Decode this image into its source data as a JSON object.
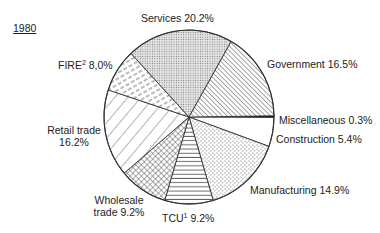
{
  "chart_data": {
    "type": "pie",
    "title": "1980",
    "start_angle_deg": 0,
    "direction": "clockwise",
    "slices": [
      {
        "label": "Miscellaneous",
        "value": 0.3,
        "display": "Miscellaneous 0.3%",
        "pattern": "solid-black"
      },
      {
        "label": "Construction",
        "value": 5.4,
        "display": "Construction 5.4%",
        "pattern": "blank"
      },
      {
        "label": "Manufacturing",
        "value": 14.9,
        "display": "Manufacturing 14.9%",
        "pattern": "stipple"
      },
      {
        "label": "TCU",
        "footnote": "1",
        "value": 9.2,
        "display": "TCU 9.2%",
        "pattern": "horizontal-lines"
      },
      {
        "label": "Wholesale trade",
        "value": 9.2,
        "display": "Wholesale trade 9.2%",
        "pattern": "crosshatch"
      },
      {
        "label": "Retail trade",
        "value": 16.2,
        "display": "Retail trade 16.2%",
        "pattern": "wide-diagonal-back"
      },
      {
        "label": "FIRE",
        "footnote": "2",
        "value": 8.0,
        "display": "FIRE 8,0%",
        "pattern": "dashed-diagonal"
      },
      {
        "label": "Services",
        "value": 20.2,
        "display": "Services 20.2%",
        "pattern": "fine-dots"
      },
      {
        "label": "Government",
        "value": 16.5,
        "display": "Government 16.5%",
        "pattern": "dense-diagonal"
      }
    ],
    "legend": "none (labels placed around pie)"
  },
  "labels": {
    "year": "1980",
    "services": "Services 20.2%",
    "government": "Government 16.5%",
    "misc": "Miscellaneous 0.3%",
    "construction": "Construction 5.4%",
    "manufacturing": "Manufacturing 14.9%",
    "tcu_name": "TCU",
    "tcu_sup": "1",
    "tcu_value": "9.2%",
    "wholesale_line1": "Wholesale",
    "wholesale_line2": "trade 9.2%",
    "retail_line1": "Retail trade",
    "retail_line2": "16.2%",
    "fire_name": "FIRE",
    "fire_sup": "2",
    "fire_value": "8,0%"
  }
}
